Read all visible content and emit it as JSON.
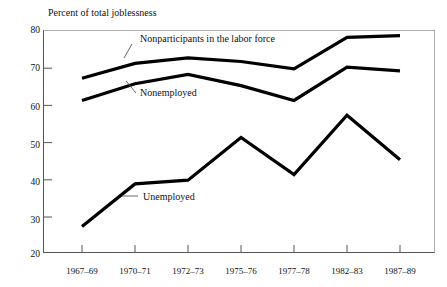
{
  "chart_data": {
    "type": "line",
    "title": "Percent of total joblessness",
    "xlabel": "",
    "ylabel": "",
    "ylim": [
      20,
      80
    ],
    "yticks": [
      20,
      30,
      40,
      50,
      60,
      70,
      80
    ],
    "grid": false,
    "legend_position": "inline-annotations",
    "categories": [
      "1967–69",
      "1970–71",
      "1972–73",
      "1975–76",
      "1977–78",
      "1982–83",
      "1987–89"
    ],
    "series": [
      {
        "name": "Nonparticipants in the labor force",
        "values": [
          67,
          71,
          72.5,
          71.5,
          69.5,
          78,
          78.5
        ]
      },
      {
        "name": "Nonemployed",
        "values": [
          61,
          65.5,
          68,
          65,
          61,
          70,
          69
        ]
      },
      {
        "name": "Unemployed",
        "values": [
          27,
          38.5,
          39.5,
          51,
          41,
          57,
          45
        ]
      }
    ],
    "annotations": [
      {
        "text": "Nonparticipants in the labor force",
        "series": "Nonparticipants in the labor force"
      },
      {
        "text": "Nonemployed",
        "series": "Nonemployed"
      },
      {
        "text": "Unemployed",
        "series": "Unemployed"
      }
    ],
    "colors": {
      "line": "#000000",
      "axis": "#555555",
      "background": "#ffffff",
      "text": "#111111"
    }
  },
  "axis": {
    "y_tick_labels": [
      "80",
      "70",
      "60",
      "50",
      "40",
      "30",
      "20"
    ],
    "x_tick_labels": [
      "1967–69",
      "1970–71",
      "1972–73",
      "1975–76",
      "1977–78",
      "1982–83",
      "1987–89"
    ]
  },
  "labels": {
    "title": "Percent of total joblessness",
    "nonparticipants": "Nonparticipants in the labor force",
    "nonemployed": "Nonemployed",
    "unemployed": "Unemployed"
  }
}
